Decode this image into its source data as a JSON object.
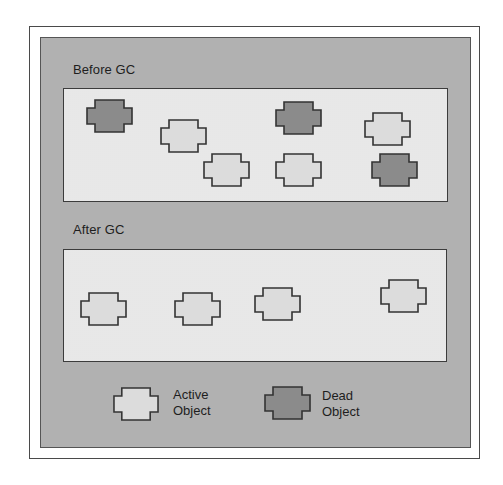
{
  "diagram": {
    "colors": {
      "page_bg": "#ffffff",
      "canvas_bg": "#b9b9b9",
      "heap_bg": "#ececec",
      "active_fill": "#dcdcdc",
      "dead_fill": "#8b8b8b",
      "stroke": "#333333"
    },
    "sections": [
      {
        "label": "Before GC",
        "objects": [
          {
            "type": "dead",
            "x": 86,
            "y": 99
          },
          {
            "type": "active",
            "x": 160,
            "y": 119
          },
          {
            "type": "active",
            "x": 203,
            "y": 153
          },
          {
            "type": "dead",
            "x": 275,
            "y": 101
          },
          {
            "type": "active",
            "x": 275,
            "y": 153
          },
          {
            "type": "active",
            "x": 364,
            "y": 112
          },
          {
            "type": "dead",
            "x": 371,
            "y": 153
          }
        ]
      },
      {
        "label": "After GC",
        "objects": [
          {
            "type": "active",
            "x": 80,
            "y": 292
          },
          {
            "type": "active",
            "x": 174,
            "y": 292
          },
          {
            "type": "active",
            "x": 254,
            "y": 287
          },
          {
            "type": "active",
            "x": 380,
            "y": 279
          }
        ]
      }
    ],
    "legend": {
      "active": {
        "line1": "Active",
        "line2": "Object"
      },
      "dead": {
        "line1": "Dead",
        "line2": "Object"
      }
    }
  }
}
